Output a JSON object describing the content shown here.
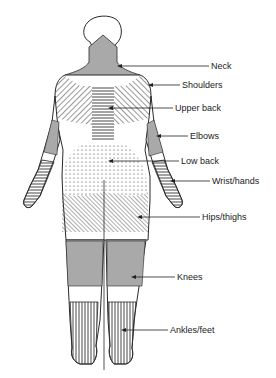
{
  "figure": {
    "regions": [
      {
        "id": "neck",
        "label": "Neck",
        "pattern": "solid-gray",
        "label_x": 211,
        "label_y": 62,
        "arrow_from": 209,
        "arrow_to": 117,
        "arrow_y": 66
      },
      {
        "id": "shoulders",
        "label": "Shoulders",
        "pattern": "diagonal-lines",
        "label_x": 182,
        "label_y": 81,
        "arrow_from": 180,
        "arrow_to": 148,
        "arrow_y": 85
      },
      {
        "id": "upper-back",
        "label": "Upper back",
        "pattern": "horizontal-lines",
        "label_x": 175,
        "label_y": 104,
        "arrow_from": 173,
        "arrow_to": 108,
        "arrow_y": 108
      },
      {
        "id": "elbows",
        "label": "Elbows",
        "pattern": "solid-gray",
        "label_x": 190,
        "label_y": 132,
        "arrow_from": 188,
        "arrow_to": 156,
        "arrow_y": 136
      },
      {
        "id": "low-back",
        "label": "Low back",
        "pattern": "dots",
        "label_x": 181,
        "label_y": 157,
        "arrow_from": 179,
        "arrow_to": 108,
        "arrow_y": 161
      },
      {
        "id": "wrist-hands",
        "label": "Wrist/hands",
        "pattern": "horizontal-lines",
        "label_x": 212,
        "label_y": 177,
        "arrow_from": 210,
        "arrow_to": 170,
        "arrow_y": 181
      },
      {
        "id": "hips-thighs",
        "label": "Hips/thighs",
        "pattern": "diagonal-lines",
        "label_x": 202,
        "label_y": 213,
        "arrow_from": 200,
        "arrow_to": 137,
        "arrow_y": 217
      },
      {
        "id": "knees",
        "label": "Knees",
        "pattern": "solid-gray",
        "label_x": 177,
        "label_y": 273,
        "arrow_from": 175,
        "arrow_to": 131,
        "arrow_y": 277
      },
      {
        "id": "ankles-feet",
        "label": "Ankles/feet",
        "pattern": "vertical-lines",
        "label_x": 170,
        "label_y": 326,
        "arrow_from": 168,
        "arrow_to": 121,
        "arrow_y": 330
      }
    ]
  },
  "colors": {
    "outline": "#2a2a2a",
    "gray_fill": "#a9a9a9",
    "hatch": "#333333",
    "background": "#ffffff",
    "label": "#222222"
  }
}
